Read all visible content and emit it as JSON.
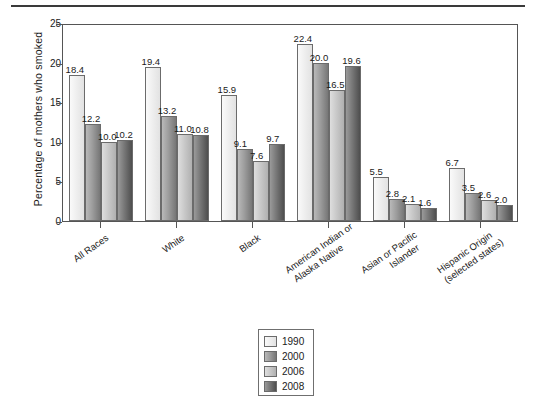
{
  "chart_data": {
    "type": "bar",
    "title": "",
    "xlabel": "",
    "ylabel": "Percentage of mothers who smoked",
    "ylim": [
      0,
      25
    ],
    "yticks": [
      "0",
      "5",
      "10",
      "15",
      "20",
      "25"
    ],
    "grid": false,
    "legend_position": "bottom-center",
    "categories": [
      "All Races",
      "White",
      "Black",
      "American Indian or\nAlaska Native",
      "Asian or Pacific\nIslander",
      "Hispanic Origin\n(selected states)"
    ],
    "category_lines": [
      [
        "All Races"
      ],
      [
        "White"
      ],
      [
        "Black"
      ],
      [
        "American Indian or",
        "Alaska Native"
      ],
      [
        "Asian or Pacific",
        "Islander"
      ],
      [
        "Hispanic Origin",
        "(selected states)"
      ]
    ],
    "series": [
      {
        "name": "1990",
        "values": [
          18.4,
          19.4,
          15.9,
          22.4,
          5.5,
          6.7
        ],
        "labels": [
          "18.4",
          "19.4",
          "15.9",
          "22.4",
          "5.5",
          "6.7"
        ]
      },
      {
        "name": "2000",
        "values": [
          12.2,
          13.2,
          9.1,
          20.0,
          2.8,
          3.5
        ],
        "labels": [
          "12.2",
          "13.2",
          "9.1",
          "20.0",
          "2.8",
          "3.5"
        ]
      },
      {
        "name": "2006",
        "values": [
          10.0,
          11.0,
          7.6,
          16.5,
          2.1,
          2.6
        ],
        "labels": [
          "10.0",
          "11.0",
          "7.6",
          "16.5",
          "2.1",
          "2.6"
        ]
      },
      {
        "name": "2008",
        "values": [
          10.2,
          10.8,
          9.7,
          19.6,
          1.6,
          2.0
        ],
        "labels": [
          "10.2",
          "10.8",
          "9.7",
          "19.6",
          "1.6",
          "2.0"
        ]
      }
    ],
    "series_colors": [
      "#efefef",
      "#9d9d9d",
      "#c9c9c9",
      "#777777"
    ],
    "legend_entries": [
      "1990",
      "2000",
      "2006",
      "2008"
    ]
  }
}
